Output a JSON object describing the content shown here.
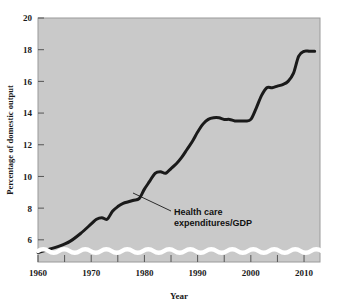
{
  "chart_data": {
    "type": "line",
    "title": "",
    "xlabel": "Year",
    "ylabel": "Percentage of domestic output",
    "xlim": [
      1960,
      2013
    ],
    "ylim": [
      4.6,
      20
    ],
    "grid": false,
    "legend": "none",
    "axis_break": "wavy band at bottom of y-axis (scale does not start at zero)",
    "xticks": [
      1960,
      1970,
      1980,
      1990,
      2000,
      2010
    ],
    "xtick_labels": [
      "1960",
      "1970",
      "1980",
      "1990",
      "2000",
      "2010"
    ],
    "xticks_minor": [
      1965,
      1975,
      1985,
      1995,
      2005
    ],
    "yticks": [
      6,
      8,
      10,
      12,
      14,
      16,
      18,
      20
    ],
    "ytick_labels": [
      "6",
      "8",
      "10",
      "12",
      "14",
      "16",
      "18",
      "20"
    ],
    "annotations": [
      {
        "text_line1": "Health care",
        "text_line2": "expenditures/GDP",
        "points_to_year": 1979,
        "points_to_value": 8.6
      }
    ],
    "series": [
      {
        "name": "Health care expenditures/GDP",
        "color": "#1a1a1a",
        "x": [
          1960,
          1962,
          1964,
          1966,
          1968,
          1970,
          1971,
          1972,
          1973,
          1974,
          1975,
          1976,
          1977,
          1978,
          1979,
          1980,
          1981,
          1982,
          1983,
          1984,
          1985,
          1986,
          1987,
          1988,
          1989,
          1990,
          1991,
          1992,
          1993,
          1994,
          1995,
          1996,
          1997,
          1998,
          1999,
          2000,
          2001,
          2002,
          2003,
          2004,
          2005,
          2006,
          2007,
          2008,
          2009,
          2010,
          2011,
          2012
        ],
        "values": [
          5.2,
          5.4,
          5.6,
          5.9,
          6.4,
          7.0,
          7.3,
          7.4,
          7.3,
          7.8,
          8.1,
          8.3,
          8.4,
          8.5,
          8.6,
          9.2,
          9.7,
          10.2,
          10.3,
          10.2,
          10.5,
          10.8,
          11.2,
          11.7,
          12.2,
          12.8,
          13.3,
          13.6,
          13.7,
          13.7,
          13.6,
          13.6,
          13.5,
          13.5,
          13.5,
          13.6,
          14.3,
          15.1,
          15.6,
          15.6,
          15.7,
          15.8,
          16.0,
          16.5,
          17.6,
          17.9,
          17.9,
          17.9
        ]
      }
    ]
  },
  "figure": {
    "plot_bg_color": "#c9c9c9",
    "frame_color": "#9a9a9a",
    "line_color": "#1a1a1a",
    "break_band_color": "#ffffff"
  }
}
